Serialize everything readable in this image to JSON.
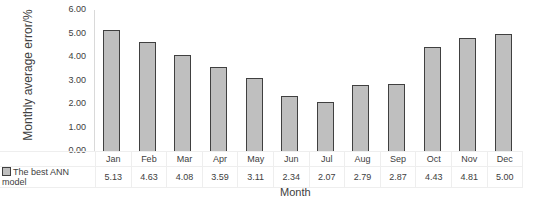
{
  "chart_data": {
    "type": "bar",
    "title": "",
    "xlabel": "Month",
    "ylabel": "Monthly average error/%",
    "ylim": [
      0,
      6
    ],
    "yticks": [
      "0.00",
      "1.00",
      "2.00",
      "3.00",
      "4.00",
      "5.00",
      "6.00"
    ],
    "grid": false,
    "legend_position": "data-table",
    "categories": [
      "Jan",
      "Feb",
      "Mar",
      "Apr",
      "May",
      "Jun",
      "Jul",
      "Aug",
      "Sep",
      "Oct",
      "Nov",
      "Dec"
    ],
    "series": [
      {
        "name": "The best ANN model",
        "values": [
          5.13,
          4.63,
          4.08,
          3.59,
          3.11,
          2.34,
          2.07,
          2.79,
          2.87,
          4.43,
          4.81,
          5.0
        ],
        "labels": [
          "5.13",
          "4.63",
          "4.08",
          "3.59",
          "3.11",
          "2.34",
          "2.07",
          "2.79",
          "2.87",
          "4.43",
          "4.81",
          "5.00"
        ],
        "color": "#bfbfbf",
        "edge_color": "#404040"
      }
    ]
  }
}
